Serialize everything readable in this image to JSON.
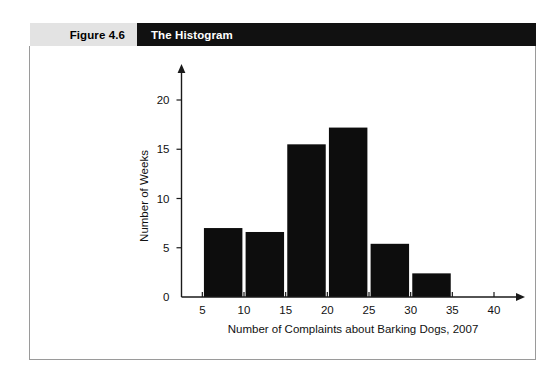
{
  "caption": {
    "number": "Figure 4.6",
    "title": "The Histogram"
  },
  "chart_data": {
    "type": "bar",
    "title": "The Histogram",
    "xlabel": "Number of Complaints about Barking Dogs, 2007",
    "ylabel": "Number of Weeks",
    "categories": [
      "5-10",
      "10-15",
      "15-20",
      "20-25",
      "25-30",
      "30-35"
    ],
    "bin_edges": [
      5,
      10,
      15,
      20,
      25,
      30,
      35
    ],
    "values": [
      7.0,
      6.6,
      15.5,
      17.2,
      5.4,
      2.4
    ],
    "xticks": [
      5,
      10,
      15,
      20,
      25,
      30,
      35,
      40
    ],
    "xtick_labels": [
      "5",
      "10",
      "15",
      "20",
      "25",
      "30",
      "35",
      "40"
    ],
    "yticks": [
      0,
      5,
      10,
      15,
      20
    ],
    "ytick_labels": [
      "0",
      "5",
      "10",
      "15",
      "20"
    ],
    "xlim": [
      2.5,
      43
    ],
    "ylim": [
      0,
      22.5
    ],
    "grid": false,
    "legend": false,
    "bar_color": "#0d0d0d"
  },
  "style": {
    "caption_band_color": "#e3e3e3",
    "caption_title_color": "#111111",
    "frame_border_color": "#9a9a9a",
    "background": "#ffffff"
  }
}
